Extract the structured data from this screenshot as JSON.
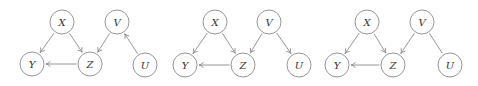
{
  "diagrams": [
    {
      "id": "graph-1",
      "nodes": [
        {
          "label": "X",
          "x": 62,
          "y": 22
        },
        {
          "label": "V",
          "x": 117,
          "y": 22
        },
        {
          "label": "Y",
          "x": 32,
          "y": 64
        },
        {
          "label": "Z",
          "x": 90,
          "y": 64
        },
        {
          "label": "U",
          "x": 145,
          "y": 65
        }
      ],
      "edges": [
        {
          "from": "X",
          "to": "Y",
          "directed": true
        },
        {
          "from": "X",
          "to": "Z",
          "directed": true
        },
        {
          "from": "Z",
          "to": "Y",
          "directed": true
        },
        {
          "from": "V",
          "to": "Z",
          "directed": true
        },
        {
          "from": "U",
          "to": "V",
          "directed": true
        }
      ]
    },
    {
      "id": "graph-2",
      "nodes": [
        {
          "label": "X",
          "x": 215,
          "y": 22
        },
        {
          "label": "V",
          "x": 269,
          "y": 22
        },
        {
          "label": "Y",
          "x": 185,
          "y": 65
        },
        {
          "label": "Z",
          "x": 243,
          "y": 65
        },
        {
          "label": "U",
          "x": 299,
          "y": 65
        }
      ],
      "edges": [
        {
          "from": "X",
          "to": "Y",
          "directed": true
        },
        {
          "from": "X",
          "to": "Z",
          "directed": true
        },
        {
          "from": "Z",
          "to": "Y",
          "directed": true
        },
        {
          "from": "V",
          "to": "Z",
          "directed": true
        },
        {
          "from": "V",
          "to": "U",
          "directed": true
        }
      ]
    },
    {
      "id": "graph-3",
      "nodes": [
        {
          "label": "X",
          "x": 367,
          "y": 22
        },
        {
          "label": "V",
          "x": 422,
          "y": 22
        },
        {
          "label": "Y",
          "x": 337,
          "y": 65
        },
        {
          "label": "Z",
          "x": 393,
          "y": 65
        },
        {
          "label": "U",
          "x": 450,
          "y": 65
        }
      ],
      "edges": [
        {
          "from": "X",
          "to": "Y",
          "directed": true
        },
        {
          "from": "X",
          "to": "Z",
          "directed": true
        },
        {
          "from": "Z",
          "to": "Y",
          "directed": true
        },
        {
          "from": "V",
          "to": "Z",
          "directed": true
        },
        {
          "from": "V",
          "to": "U",
          "directed": false
        }
      ]
    }
  ],
  "style": {
    "node_radius": 12,
    "stroke_color": "#8a8a8a",
    "label_color": "#333333"
  }
}
